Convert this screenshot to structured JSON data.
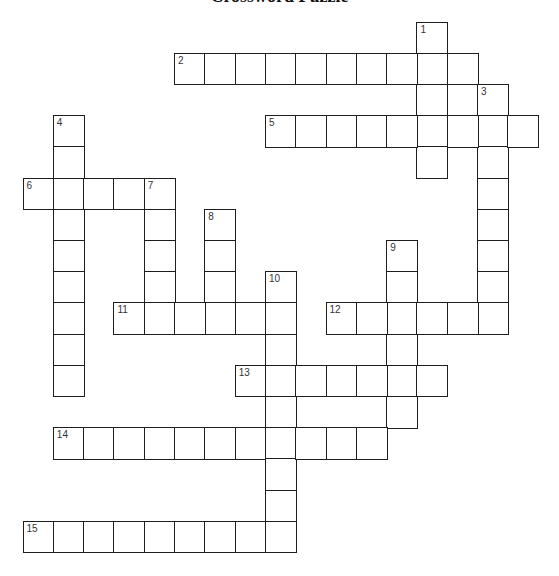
{
  "title": "Crossword Puzzle",
  "grid": {
    "origin_x": 23.3,
    "origin_y": 22.3,
    "cell_w": 30.3,
    "cell_h": 31.2,
    "line_color": "#1e1e1e"
  },
  "entries": [
    {
      "number": "1",
      "direction": "down",
      "row": 0,
      "col": 13,
      "length": 5
    },
    {
      "number": "2",
      "direction": "across",
      "row": 1,
      "col": 5,
      "length": 10
    },
    {
      "number": "3",
      "direction": "down",
      "row": 2,
      "col": 15,
      "length": 8
    },
    {
      "number": "4",
      "direction": "down",
      "row": 3,
      "col": 1,
      "length": 9
    },
    {
      "number": "5",
      "direction": "across",
      "row": 3,
      "col": 8,
      "length": 9
    },
    {
      "number": "6",
      "direction": "across",
      "row": 5,
      "col": 0,
      "length": 5
    },
    {
      "number": "7",
      "direction": "down",
      "row": 5,
      "col": 4,
      "length": 5
    },
    {
      "number": "8",
      "direction": "down",
      "row": 6,
      "col": 6,
      "length": 4
    },
    {
      "number": "9",
      "direction": "down",
      "row": 7,
      "col": 12,
      "length": 6
    },
    {
      "number": "10",
      "direction": "down",
      "row": 8,
      "col": 8,
      "length": 9
    },
    {
      "number": "11",
      "direction": "across",
      "row": 9,
      "col": 3,
      "length": 6
    },
    {
      "number": "12",
      "direction": "across",
      "row": 9,
      "col": 10,
      "length": 6
    },
    {
      "number": "13",
      "direction": "across",
      "row": 11,
      "col": 7,
      "length": 7
    },
    {
      "number": "14",
      "direction": "across",
      "row": 13,
      "col": 1,
      "length": 11
    },
    {
      "number": "15",
      "direction": "across",
      "row": 16,
      "col": 0,
      "length": 9
    }
  ]
}
